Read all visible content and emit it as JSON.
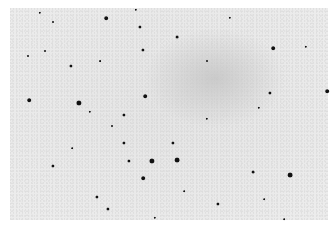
{
  "image": {
    "type": "inverted star field photograph",
    "background_color": "#e8e8e8",
    "star_color": "#111111",
    "stars": [
      {
        "x": 40,
        "y": 13,
        "r": 1.2
      },
      {
        "x": 53,
        "y": 22,
        "r": 1
      },
      {
        "x": 106,
        "y": 18,
        "r": 1.8
      },
      {
        "x": 136,
        "y": 10,
        "r": 1.2
      },
      {
        "x": 140,
        "y": 27,
        "r": 1.6
      },
      {
        "x": 143,
        "y": 50,
        "r": 1.6
      },
      {
        "x": 45,
        "y": 51,
        "r": 1
      },
      {
        "x": 28,
        "y": 56,
        "r": 1
      },
      {
        "x": 71,
        "y": 66,
        "r": 1.6
      },
      {
        "x": 29,
        "y": 100,
        "r": 1.8
      },
      {
        "x": 79,
        "y": 103,
        "r": 2.6
      },
      {
        "x": 145,
        "y": 96,
        "r": 1.8
      },
      {
        "x": 100,
        "y": 61,
        "r": 0.9
      },
      {
        "x": 230,
        "y": 18,
        "r": 1.2
      },
      {
        "x": 177,
        "y": 37,
        "r": 1.4
      },
      {
        "x": 273,
        "y": 48,
        "r": 1.8
      },
      {
        "x": 306,
        "y": 47,
        "r": 1.2
      },
      {
        "x": 207,
        "y": 61,
        "r": 1
      },
      {
        "x": 270,
        "y": 93,
        "r": 1.6
      },
      {
        "x": 327,
        "y": 91,
        "r": 1.8
      },
      {
        "x": 259,
        "y": 108,
        "r": 1.2
      },
      {
        "x": 90,
        "y": 112,
        "r": 1.2
      },
      {
        "x": 124,
        "y": 115,
        "r": 1.6
      },
      {
        "x": 112,
        "y": 126,
        "r": 1
      },
      {
        "x": 124,
        "y": 143,
        "r": 1.6
      },
      {
        "x": 53,
        "y": 166,
        "r": 1.6
      },
      {
        "x": 129,
        "y": 161,
        "r": 1.6
      },
      {
        "x": 152,
        "y": 161,
        "r": 2.6
      },
      {
        "x": 143,
        "y": 178,
        "r": 1.8
      },
      {
        "x": 97,
        "y": 197,
        "r": 1.6
      },
      {
        "x": 108,
        "y": 209,
        "r": 1.6
      },
      {
        "x": 155,
        "y": 218,
        "r": 1.2
      },
      {
        "x": 72,
        "y": 148,
        "r": 0.8
      },
      {
        "x": 207,
        "y": 119,
        "r": 1.2
      },
      {
        "x": 173,
        "y": 143,
        "r": 1.6
      },
      {
        "x": 177,
        "y": 160,
        "r": 2.4
      },
      {
        "x": 253,
        "y": 172,
        "r": 1.4
      },
      {
        "x": 290,
        "y": 175,
        "r": 2.4
      },
      {
        "x": 218,
        "y": 204,
        "r": 1.6
      },
      {
        "x": 184,
        "y": 191,
        "r": 0.8
      },
      {
        "x": 264,
        "y": 199,
        "r": 0.8
      },
      {
        "x": 284,
        "y": 219,
        "r": 0.8
      }
    ]
  }
}
